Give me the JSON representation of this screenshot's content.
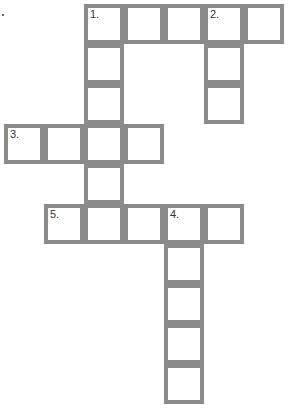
{
  "puzzle": {
    "type": "crossword",
    "cell_size_px": 40,
    "grid_origin": [
      4,
      4
    ],
    "border_color": "#8a8a8a",
    "cells": [
      {
        "row": 0,
        "col": 2,
        "number": "1."
      },
      {
        "row": 0,
        "col": 3
      },
      {
        "row": 0,
        "col": 4
      },
      {
        "row": 0,
        "col": 5,
        "number": "2."
      },
      {
        "row": 0,
        "col": 6
      },
      {
        "row": 1,
        "col": 2
      },
      {
        "row": 1,
        "col": 5
      },
      {
        "row": 2,
        "col": 2
      },
      {
        "row": 2,
        "col": 5
      },
      {
        "row": 3,
        "col": 0,
        "number": "3."
      },
      {
        "row": 3,
        "col": 1
      },
      {
        "row": 3,
        "col": 2
      },
      {
        "row": 3,
        "col": 3
      },
      {
        "row": 4,
        "col": 2
      },
      {
        "row": 5,
        "col": 1,
        "number": "5."
      },
      {
        "row": 5,
        "col": 2
      },
      {
        "row": 5,
        "col": 3
      },
      {
        "row": 5,
        "col": 4,
        "number": "4."
      },
      {
        "row": 5,
        "col": 5
      },
      {
        "row": 6,
        "col": 4
      },
      {
        "row": 7,
        "col": 4
      },
      {
        "row": 8,
        "col": 4
      },
      {
        "row": 9,
        "col": 4
      }
    ],
    "entries": [
      {
        "number": "1.",
        "direction": "across",
        "length": 5
      },
      {
        "number": "1.",
        "direction": "down",
        "length": 6
      },
      {
        "number": "2.",
        "direction": "down",
        "length": 3
      },
      {
        "number": "3.",
        "direction": "across",
        "length": 4
      },
      {
        "number": "4.",
        "direction": "down",
        "length": 5
      },
      {
        "number": "5.",
        "direction": "across",
        "length": 5
      }
    ]
  }
}
